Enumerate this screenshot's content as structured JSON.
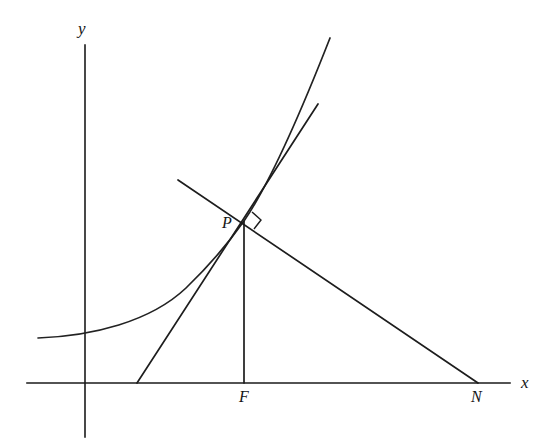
{
  "figure": {
    "kind": "geometry-diagram",
    "background_color": "#ffffff",
    "stroke_color": "#1d1d1d"
  },
  "axes": {
    "x_label": "x",
    "y_label": "y",
    "x_axis": {
      "x1": 27,
      "y1": 383,
      "x2": 510,
      "y2": 383
    },
    "y_axis": {
      "x1": 85,
      "y1": 45,
      "x2": 85,
      "y2": 437
    }
  },
  "points": [
    {
      "name": "P",
      "label": "P",
      "x": 244,
      "y": 221
    },
    {
      "name": "F",
      "label": "F",
      "x": 244,
      "y": 383
    },
    {
      "name": "N",
      "label": "N",
      "x": 478,
      "y": 383
    }
  ],
  "curves": {
    "exponential": {
      "name": "curve",
      "path": "M 38 338 C 92 336, 150 322, 186 288 C 214 261, 232 238, 244 221 C 264 192, 290 140, 330 38"
    },
    "tangent": {
      "name": "tangent-at-P",
      "x1": 137,
      "y1": 383,
      "x2": 318,
      "y2": 104
    },
    "normal": {
      "name": "normal-at-P",
      "x1": 178,
      "y1": 180,
      "x2": 478,
      "y2": 383
    },
    "ordinate": {
      "name": "ordinate-PF",
      "x1": 244,
      "y1": 221,
      "x2": 244,
      "y2": 383
    }
  },
  "markers": {
    "right_angle": {
      "name": "right-angle-at-P",
      "path": "M 252 212 L 261 220 L 254 229"
    }
  }
}
